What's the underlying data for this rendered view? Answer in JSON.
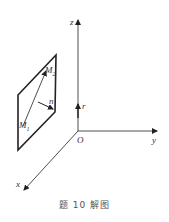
{
  "figure": {
    "caption": "题 10 解图",
    "axes": {
      "x_label": "x",
      "y_label": "y",
      "z_label": "z",
      "origin_label": "O"
    },
    "vectors": {
      "r_label": "r",
      "n_label": "n"
    },
    "points": {
      "m1_label": "M",
      "m1_sub": "1",
      "m2_label": "M",
      "m2_sub": "2"
    },
    "colors": {
      "stroke": "#222222",
      "text": "#333333"
    }
  }
}
